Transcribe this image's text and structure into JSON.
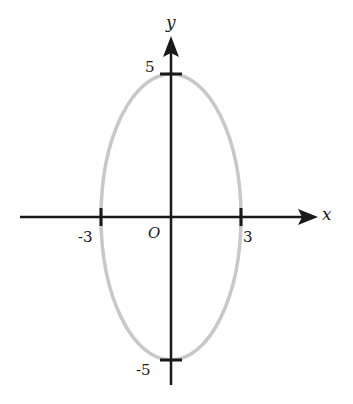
{
  "diagram": {
    "type": "ellipse-on-coordinate-axes",
    "colors": {
      "axis": "#1a1a1a",
      "ellipse": "#c8c8c8",
      "background": "#ffffff"
    },
    "axes": {
      "x_label": "x",
      "y_label": "y",
      "origin_label": "O"
    },
    "ticks": {
      "x_neg": "-3",
      "x_pos": "3",
      "y_pos": "5",
      "y_neg": "-5"
    },
    "ellipse": {
      "center": [
        0,
        0
      ],
      "semi_axis_x": 3,
      "semi_axis_y": 5
    }
  }
}
